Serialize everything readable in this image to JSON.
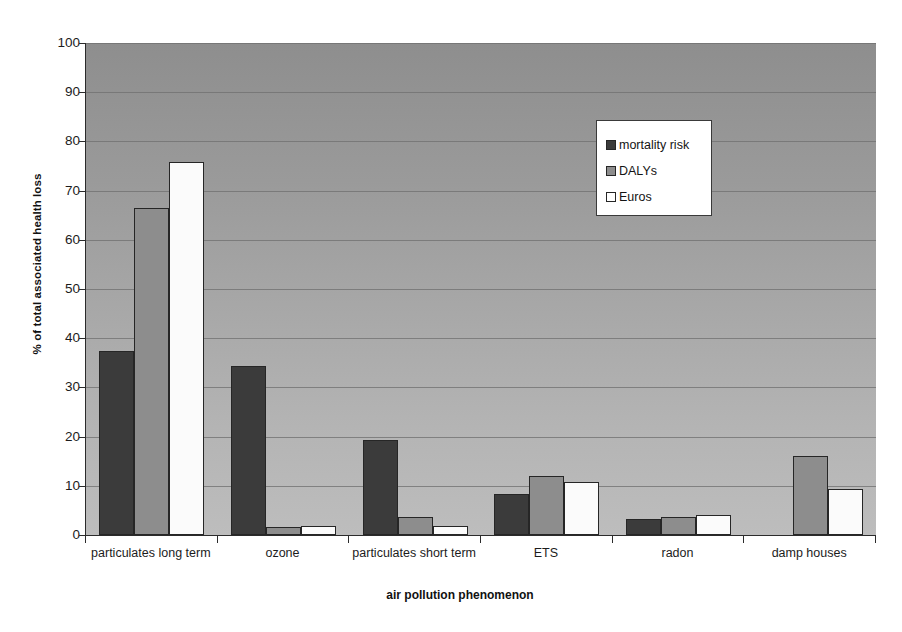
{
  "chart_data": {
    "type": "bar",
    "title": "",
    "xlabel": "air pollution phenomenon",
    "ylabel": "% of total associated health loss",
    "ylim": [
      0,
      100
    ],
    "yticks": [
      0,
      10,
      20,
      30,
      40,
      50,
      60,
      70,
      80,
      90,
      100
    ],
    "grid": true,
    "legend_position": "upper-center-right",
    "categories": [
      "particulates long term",
      "ozone",
      "particulates short term",
      "ETS",
      "radon",
      "damp houses"
    ],
    "series": [
      {
        "name": "mortality risk",
        "color": "#3b3b3b",
        "values": [
          37.4,
          34.3,
          19.4,
          8.3,
          3.2,
          0
        ]
      },
      {
        "name": "DALYs",
        "color": "#8d8d8d",
        "values": [
          66.5,
          1.6,
          3.7,
          11.9,
          3.7,
          16.0
        ]
      },
      {
        "name": "Euros",
        "color": "#fbfbfb",
        "values": [
          75.8,
          1.9,
          1.9,
          10.7,
          4.0,
          9.4
        ]
      }
    ]
  },
  "axes": {
    "y_title": "% of total associated health loss",
    "x_title": "air pollution phenomenon"
  },
  "legend": {
    "items": [
      {
        "label": "mortality risk",
        "swatch": "dark-gray-swatch"
      },
      {
        "label": "DALYs",
        "swatch": "medium-gray-swatch"
      },
      {
        "label": "Euros",
        "swatch": "white-swatch"
      }
    ]
  }
}
